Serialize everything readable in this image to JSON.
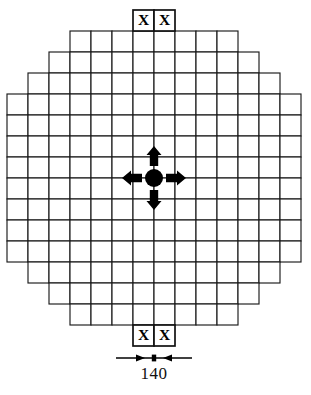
{
  "figure": {
    "background_color": "#ffffff",
    "line_color": "#1a1a1a"
  },
  "grid": {
    "columns": 14,
    "rows": 14,
    "cell_size": 21,
    "origin_x": 7,
    "origin_y": 31,
    "row_widths": [
      8,
      10,
      12,
      14,
      14,
      14,
      14,
      14,
      14,
      14,
      14,
      12,
      10,
      8
    ],
    "row_offsets": [
      3,
      2,
      1,
      0,
      0,
      0,
      0,
      0,
      0,
      0,
      0,
      1,
      2,
      3
    ],
    "description": "Octagonal core lattice map"
  },
  "markers": {
    "top": {
      "labels": [
        "X",
        "X"
      ],
      "columns": [
        6,
        7
      ],
      "position": "above-grid"
    },
    "bottom": {
      "labels": [
        "X",
        "X"
      ],
      "columns": [
        6,
        7
      ],
      "position": "below-grid"
    }
  },
  "center_indicator": {
    "name": "center-node",
    "shape": "filled-circle",
    "radius": 9,
    "color": "#000000",
    "arrows": [
      "up",
      "down",
      "left",
      "right"
    ],
    "grid_column": 7,
    "grid_row": 7
  },
  "dimension": {
    "label": "140",
    "line_style": "double-ended-tick",
    "span_columns": 2
  }
}
